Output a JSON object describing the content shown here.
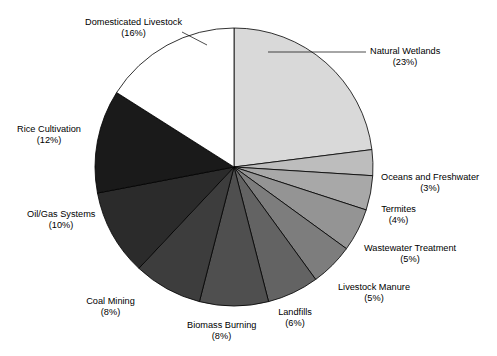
{
  "chart_data": {
    "type": "pie",
    "title": "",
    "xlabel": "",
    "ylabel": "",
    "legend_position": "none",
    "grid": false,
    "units": "percent",
    "categories": [
      "Natural Wetlands",
      "Oceans and Freshwater",
      "Termites",
      "Wastewater Treatment",
      "Livestock Manure",
      "Landfills",
      "Biomass Burning",
      "Coal Mining",
      "Oil/Gas Systems",
      "Rice Cultivation",
      "Domesticated Livestock"
    ],
    "values": [
      23,
      3,
      4,
      5,
      5,
      6,
      8,
      8,
      10,
      12,
      16
    ],
    "slices": [
      {
        "label": "Natural Wetlands",
        "percent": 23,
        "percent_text": "(23%)",
        "color": "#d9d9d9",
        "label_x": 370,
        "label_y": 46,
        "align": "left"
      },
      {
        "label": "Oceans and Freshwater",
        "percent": 3,
        "percent_text": "(3%)",
        "color": "#bdbdbd",
        "label_x": 381,
        "label_y": 172,
        "align": "left"
      },
      {
        "label": "Termites",
        "percent": 4,
        "percent_text": "(4%)",
        "color": "#a8a8a8",
        "label_x": 381,
        "label_y": 204,
        "align": "left"
      },
      {
        "label": "Wastewater Treatment",
        "percent": 5,
        "percent_text": "(5%)",
        "color": "#949494",
        "label_x": 364,
        "label_y": 243,
        "align": "left"
      },
      {
        "label": "Livestock Manure",
        "percent": 5,
        "percent_text": "(5%)",
        "color": "#7d7d7d",
        "label_x": 338,
        "label_y": 282,
        "align": "left"
      },
      {
        "label": "Landfills",
        "percent": 6,
        "percent_text": "(6%)",
        "color": "#636363",
        "label_x": 278,
        "label_y": 307,
        "align": "left"
      },
      {
        "label": "Biomass Burning",
        "percent": 8,
        "percent_text": "(8%)",
        "color": "#4f4f4f",
        "label_x": 187,
        "label_y": 320,
        "align": "left"
      },
      {
        "label": "Coal Mining",
        "percent": 8,
        "percent_text": "(8%)",
        "color": "#3d3d3d",
        "label_x": 86,
        "label_y": 296,
        "align": "left"
      },
      {
        "label": "Oil/Gas Systems",
        "percent": 10,
        "percent_text": "(10%)",
        "color": "#2b2b2b",
        "label_x": 27,
        "label_y": 209,
        "align": "left"
      },
      {
        "label": "Rice Cultivation",
        "percent": 12,
        "percent_text": "(12%)",
        "color": "#1a1a1a",
        "label_x": 17,
        "label_y": 124,
        "align": "left"
      },
      {
        "label": "Domesticated Livestock",
        "percent": 16,
        "percent_text": "(16%)",
        "color": "#ffffff",
        "label_x": 85,
        "label_y": 17,
        "align": "left"
      }
    ],
    "geometry": {
      "center_x": 234,
      "center_y": 167,
      "radius": 139,
      "start_angle_deg": -90,
      "direction": "clockwise",
      "stroke_color": "#000000",
      "stroke_width": 0.8
    },
    "leader_lines": [
      {
        "x1": 268,
        "y1": 52,
        "x2": 366,
        "y2": 52
      },
      {
        "x1": 207,
        "y1": 45,
        "x2": 182,
        "y2": 32
      }
    ]
  }
}
